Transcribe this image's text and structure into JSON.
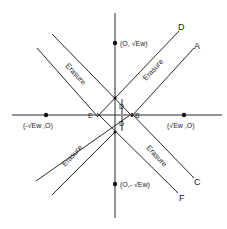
{
  "diagram": {
    "axes": {
      "origin": [
        115,
        115
      ]
    },
    "points": [
      {
        "id": "top",
        "label": "(0, √E̅w̅)",
        "text": "(O, √Ew)"
      },
      {
        "id": "bottom",
        "text": "(O,- √Ew)"
      },
      {
        "id": "left",
        "text": "(-√Ew ,O)"
      },
      {
        "id": "right",
        "text": "(√Ew ,O)"
      }
    ],
    "line_labels": {
      "A": "A",
      "C": "C",
      "D": "D",
      "F": "F"
    },
    "axis_labels": {
      "E": "E",
      "B": "B"
    },
    "distance_label": "D",
    "regions": {
      "erasure": "Erasure"
    }
  }
}
